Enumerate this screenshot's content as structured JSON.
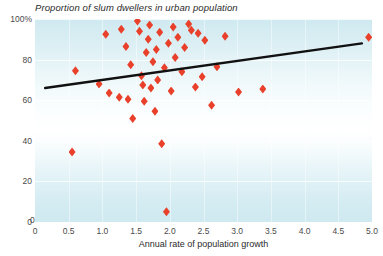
{
  "chart_data": {
    "type": "scatter",
    "title": "Proportion of slum dwellers in urban population",
    "xlabel": "Annual rate of population growth",
    "ylabel": "",
    "xlim": [
      0,
      5.0
    ],
    "ylim": [
      0,
      100
    ],
    "grid": true,
    "legend": null,
    "xticks": [
      "0",
      "0.5",
      "1.0",
      "1.5",
      "2.0",
      "2.5",
      "3.0",
      "3.5",
      "4.0",
      "4.5",
      "5.0"
    ],
    "xtick_values": [
      0,
      0.5,
      1.0,
      1.5,
      2.0,
      2.5,
      3.0,
      3.5,
      4.0,
      4.5,
      5.0
    ],
    "yticks": [
      "0",
      "20",
      "40",
      "60",
      "80",
      "100%"
    ],
    "ytick_values": [
      0,
      20,
      40,
      60,
      80,
      100
    ],
    "marker_color": "#e8402a",
    "marker_shape": "diamond",
    "background_color": "#d8eff4",
    "trendline": {
      "color": "#111111",
      "x": [
        0.15,
        4.85
      ],
      "y": [
        66.0,
        88.0
      ]
    },
    "points": [
      {
        "x": 0.55,
        "y": 34.5
      },
      {
        "x": 0.6,
        "y": 74.5
      },
      {
        "x": 0.95,
        "y": 68.0
      },
      {
        "x": 1.05,
        "y": 92.5
      },
      {
        "x": 1.1,
        "y": 63.5
      },
      {
        "x": 1.25,
        "y": 61.5
      },
      {
        "x": 1.28,
        "y": 95.0
      },
      {
        "x": 1.35,
        "y": 86.5
      },
      {
        "x": 1.38,
        "y": 60.5
      },
      {
        "x": 1.42,
        "y": 77.5
      },
      {
        "x": 1.45,
        "y": 51.0
      },
      {
        "x": 1.52,
        "y": 99.0
      },
      {
        "x": 1.55,
        "y": 94.0
      },
      {
        "x": 1.58,
        "y": 72.0
      },
      {
        "x": 1.6,
        "y": 67.5
      },
      {
        "x": 1.62,
        "y": 59.5
      },
      {
        "x": 1.65,
        "y": 83.5
      },
      {
        "x": 1.68,
        "y": 90.0
      },
      {
        "x": 1.7,
        "y": 97.0
      },
      {
        "x": 1.72,
        "y": 66.0
      },
      {
        "x": 1.75,
        "y": 79.0
      },
      {
        "x": 1.78,
        "y": 54.5
      },
      {
        "x": 1.8,
        "y": 85.0
      },
      {
        "x": 1.82,
        "y": 70.0
      },
      {
        "x": 1.85,
        "y": 93.5
      },
      {
        "x": 1.88,
        "y": 38.5
      },
      {
        "x": 1.92,
        "y": 76.0
      },
      {
        "x": 1.95,
        "y": 5.0
      },
      {
        "x": 1.98,
        "y": 88.0
      },
      {
        "x": 2.02,
        "y": 64.5
      },
      {
        "x": 2.05,
        "y": 96.0
      },
      {
        "x": 2.08,
        "y": 81.0
      },
      {
        "x": 2.12,
        "y": 91.0
      },
      {
        "x": 2.18,
        "y": 74.0
      },
      {
        "x": 2.22,
        "y": 86.0
      },
      {
        "x": 2.28,
        "y": 97.5
      },
      {
        "x": 2.32,
        "y": 94.5
      },
      {
        "x": 2.38,
        "y": 66.5
      },
      {
        "x": 2.42,
        "y": 93.0
      },
      {
        "x": 2.48,
        "y": 71.5
      },
      {
        "x": 2.52,
        "y": 89.5
      },
      {
        "x": 2.62,
        "y": 57.5
      },
      {
        "x": 2.7,
        "y": 76.5
      },
      {
        "x": 2.82,
        "y": 91.5
      },
      {
        "x": 3.02,
        "y": 64.0
      },
      {
        "x": 3.38,
        "y": 65.5
      },
      {
        "x": 4.95,
        "y": 91.0
      }
    ]
  }
}
